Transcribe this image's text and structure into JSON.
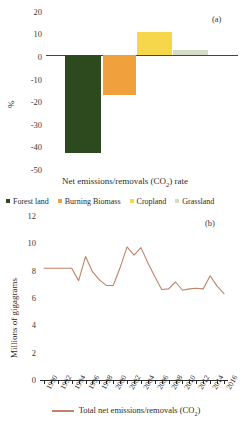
{
  "figure": {
    "panel_a_tag": "(a)",
    "panel_b_tag": "(b)"
  },
  "panel_a": {
    "ylabel": "%",
    "xlabel_parts": {
      "pre": "Net emissions/removals (CO",
      "sub": "2",
      "post": ") rate"
    },
    "xlabel": "Net emissions/removals (CO2) rate",
    "y_ticks": [
      "20",
      "10",
      "0",
      "-10",
      "-20",
      "-30",
      "-40",
      "-50"
    ],
    "legend": [
      {
        "label": "Forest land",
        "color": "#2d4a1e"
      },
      {
        "label": "Burning Biomass",
        "color": "#f0a03c"
      },
      {
        "label": "Cropland",
        "color": "#f6d64a"
      },
      {
        "label": "Grassland",
        "color": "#d4dcc5"
      }
    ]
  },
  "panel_b": {
    "ylabel": "Millions of gigagrams",
    "y_ticks": [
      "12",
      "10",
      "8",
      "6",
      "4",
      "2",
      "0"
    ],
    "legend_label_parts": {
      "pre": "Total net emissions/removals (CO",
      "sub": "2",
      "post": ")"
    },
    "legend_label": "Total net emissions/removals (CO2)",
    "line_color": "#c08368"
  },
  "chart_data": [
    {
      "type": "bar",
      "panel": "(a)",
      "title": "",
      "categories": [
        "Forest land",
        "Burning Biomass",
        "Cropland",
        "Grassland"
      ],
      "values": [
        -41.0,
        -16.5,
        9.7,
        2.5
      ],
      "colors": [
        "#2d4a1e",
        "#f0a03c",
        "#f6d64a",
        "#d4dcc5"
      ],
      "xlabel": "Net emissions/removals (CO2) rate",
      "ylabel": "%",
      "ylim": [
        -50,
        20
      ],
      "ytick_step": 10,
      "grid": false,
      "legend_position": "bottom"
    },
    {
      "type": "line",
      "panel": "(b)",
      "title": "",
      "series": [
        {
          "name": "Total net emissions/removals (CO2)",
          "color": "#c08368",
          "values": [
            8.2,
            8.2,
            8.2,
            8.2,
            8.2,
            7.3,
            9.05,
            7.95,
            7.35,
            6.95,
            6.95,
            8.25,
            9.75,
            9.15,
            9.7,
            8.6,
            7.6,
            6.65,
            6.7,
            7.2,
            6.6,
            6.7,
            6.75,
            6.7,
            7.65,
            6.9,
            6.35
          ]
        }
      ],
      "x": [
        1990,
        1991,
        1992,
        1993,
        1994,
        1995,
        1996,
        1997,
        1998,
        1999,
        2000,
        2001,
        2002,
        2003,
        2004,
        2005,
        2006,
        2007,
        2008,
        2009,
        2010,
        2011,
        2012,
        2013,
        2014,
        2015,
        2016
      ],
      "xtick_labels": [
        "1990",
        "1992",
        "1994",
        "1996",
        "1998",
        "2000",
        "2002",
        "2004",
        "2006",
        "2008",
        "2010",
        "2012",
        "2014",
        "2016"
      ],
      "xlabel": "",
      "ylabel": "Millions of gigagrams",
      "ylim": [
        0,
        12
      ],
      "ytick_step": 2,
      "grid": false,
      "legend_position": "bottom"
    }
  ]
}
